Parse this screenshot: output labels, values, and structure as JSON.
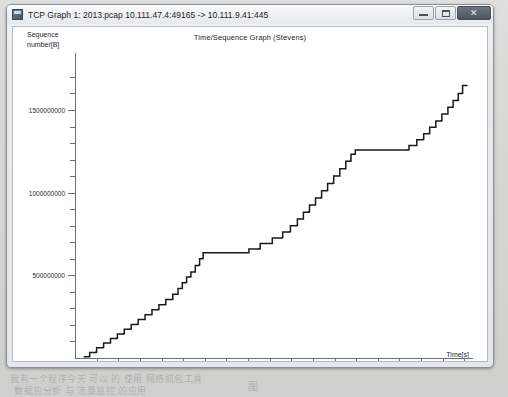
{
  "window": {
    "title": "TCP Graph 1: 2013.pcap 10.111.47.4:49165 -> 10.111.9.41:445",
    "icon": "wireshark-icon",
    "buttons": {
      "minimize": "minimize-button",
      "maximize": "maximize-button",
      "close_label": "✕"
    }
  },
  "background_text": {
    "line1": "我有一个程序今天 可以 的 使用 网络抓包工具",
    "line2": "数据包分析 与 流量监控 的应用",
    "line3": "网络协议分析与数据包捕获",
    "line4": "图",
    "line5": "软件界面"
  },
  "chart_data": {
    "type": "line",
    "title": "Time/Sequence Graph (Stevens)",
    "xlabel": "Time[s]",
    "ylabel": "Sequence number[B]",
    "xlim": [
      0,
      92
    ],
    "ylim": [
      0,
      1760000000
    ],
    "grid": false,
    "legend": null,
    "x_ticks": [
      5,
      10,
      15,
      20,
      25,
      30,
      35,
      40,
      45,
      50,
      55,
      60,
      65,
      70,
      75,
      80,
      85,
      90
    ],
    "x_tick_labels": [
      "5",
      "10",
      "15",
      "20",
      "25",
      "30",
      "35",
      "40",
      "45",
      "50",
      "55",
      "60",
      "65",
      "70",
      "75",
      "80",
      "85",
      "90"
    ],
    "y_ticks": [
      500000000,
      1000000000,
      1500000000
    ],
    "y_tick_labels": [
      "500000000",
      "1000000000",
      "1500000000"
    ],
    "y_minor_ticks": [
      100000000,
      200000000,
      300000000,
      400000000,
      600000000,
      700000000,
      800000000,
      900000000,
      1100000000,
      1200000000,
      1300000000,
      1400000000,
      1600000000,
      1700000000
    ],
    "series": [
      {
        "name": "tcp-sequence",
        "style": "step",
        "color": "#1a1a1a",
        "points": [
          [
            2.0,
            8000000
          ],
          [
            3.2,
            9000000
          ],
          [
            3.4,
            34000000
          ],
          [
            4.8,
            35000000
          ],
          [
            5.0,
            62000000
          ],
          [
            6.4,
            63000000
          ],
          [
            6.6,
            90000000
          ],
          [
            8.0,
            91000000
          ],
          [
            8.2,
            118000000
          ],
          [
            9.6,
            119000000
          ],
          [
            9.8,
            146000000
          ],
          [
            11.2,
            147000000
          ],
          [
            11.4,
            174000000
          ],
          [
            12.8,
            175000000
          ],
          [
            13.0,
            203000000
          ],
          [
            14.4,
            204000000
          ],
          [
            14.6,
            232000000
          ],
          [
            16.0,
            233000000
          ],
          [
            16.2,
            262000000
          ],
          [
            17.6,
            263000000
          ],
          [
            17.8,
            292000000
          ],
          [
            19.2,
            293000000
          ],
          [
            19.4,
            322000000
          ],
          [
            20.8,
            323000000
          ],
          [
            21.0,
            353000000
          ],
          [
            22.4,
            354000000
          ],
          [
            22.6,
            385000000
          ],
          [
            23.6,
            386000000
          ],
          [
            23.8,
            420000000
          ],
          [
            24.6,
            421000000
          ],
          [
            24.8,
            455000000
          ],
          [
            25.6,
            456000000
          ],
          [
            25.8,
            490000000
          ],
          [
            26.6,
            491000000
          ],
          [
            26.8,
            520000000
          ],
          [
            27.6,
            521000000
          ],
          [
            27.8,
            560000000
          ],
          [
            28.6,
            561000000
          ],
          [
            28.8,
            600000000
          ],
          [
            29.4,
            601000000
          ],
          [
            29.6,
            636000000
          ],
          [
            40.0,
            637000000
          ],
          [
            40.2,
            660000000
          ],
          [
            42.6,
            661000000
          ],
          [
            42.8,
            692000000
          ],
          [
            45.4,
            693000000
          ],
          [
            45.6,
            726000000
          ],
          [
            47.8,
            727000000
          ],
          [
            48.0,
            762000000
          ],
          [
            49.6,
            763000000
          ],
          [
            49.8,
            800000000
          ],
          [
            51.2,
            801000000
          ],
          [
            51.4,
            840000000
          ],
          [
            52.6,
            841000000
          ],
          [
            52.8,
            882000000
          ],
          [
            54.0,
            883000000
          ],
          [
            54.2,
            925000000
          ],
          [
            55.4,
            926000000
          ],
          [
            55.6,
            968000000
          ],
          [
            56.8,
            969000000
          ],
          [
            57.0,
            1012000000
          ],
          [
            58.2,
            1013000000
          ],
          [
            58.4,
            1056000000
          ],
          [
            59.6,
            1057000000
          ],
          [
            59.8,
            1100000000
          ],
          [
            61.0,
            1101000000
          ],
          [
            61.2,
            1144000000
          ],
          [
            62.4,
            1145000000
          ],
          [
            62.6,
            1190000000
          ],
          [
            63.6,
            1191000000
          ],
          [
            63.8,
            1232000000
          ],
          [
            64.6,
            1233000000
          ],
          [
            64.8,
            1258000000
          ],
          [
            77.0,
            1259000000
          ],
          [
            77.2,
            1285000000
          ],
          [
            78.8,
            1286000000
          ],
          [
            79.0,
            1320000000
          ],
          [
            80.4,
            1321000000
          ],
          [
            80.6,
            1356000000
          ],
          [
            81.8,
            1357000000
          ],
          [
            82.0,
            1395000000
          ],
          [
            83.2,
            1396000000
          ],
          [
            83.4,
            1434000000
          ],
          [
            84.6,
            1435000000
          ],
          [
            84.8,
            1475000000
          ],
          [
            86.0,
            1476000000
          ],
          [
            86.2,
            1516000000
          ],
          [
            87.2,
            1517000000
          ],
          [
            87.4,
            1558000000
          ],
          [
            88.4,
            1559000000
          ],
          [
            88.6,
            1600000000
          ],
          [
            89.4,
            1601000000
          ],
          [
            89.6,
            1648000000
          ],
          [
            90.6,
            1652000000
          ]
        ]
      }
    ],
    "annotations": [
      {
        "text": "plateau 1",
        "x_range": [
          29.6,
          40.0
        ],
        "y": 637000000
      },
      {
        "text": "plateau 2",
        "x_range": [
          64.8,
          77.0
        ],
        "y": 1258000000
      }
    ]
  }
}
